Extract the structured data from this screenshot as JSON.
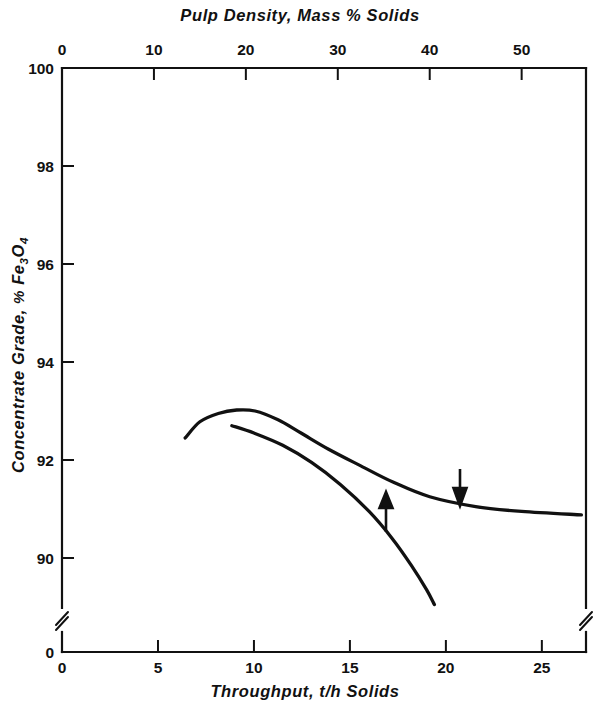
{
  "chart_data": {
    "type": "line",
    "title": "",
    "top_axis": {
      "label": "Pulp Density, Mass % Solids",
      "ticks": [
        0,
        10,
        20,
        30,
        40,
        50
      ],
      "tick_labels": [
        "0",
        "10",
        "20",
        "30",
        "40",
        "50"
      ],
      "range": [
        0,
        57
      ]
    },
    "xlabel": "Throughput, t/h Solids",
    "x_ticks": [
      0,
      5,
      10,
      15,
      20,
      25
    ],
    "x_tick_labels": [
      "0",
      "5",
      "10",
      "15",
      "20",
      "25"
    ],
    "xlim": [
      0,
      27.3
    ],
    "ylabel": "Concentrate Grade, % Fe3O4",
    "ylabel_parts": {
      "lead": "Concentrate Grade, ",
      "pct": "%",
      "fe": "Fe",
      "sub3": "3",
      "o": "O",
      "sub4": "4"
    },
    "y_ticks": [
      90,
      92,
      94,
      96,
      98,
      100
    ],
    "y_tick_labels": [
      "90",
      "92",
      "94",
      "96",
      "98",
      "100"
    ],
    "y_origin_label": "0",
    "ylim": [
      90,
      100
    ],
    "axis_break": true,
    "axis_break_note": "y-axis broken between 0 and 90; x-axis broken at both ends near origin level",
    "grid": false,
    "legend": null,
    "series": [
      {
        "name": "Pulp density curve (top axis)",
        "axis": "top",
        "arrow": "down",
        "points": [
          [
            13.4,
            92.45
          ],
          [
            15.0,
            92.78
          ],
          [
            17.0,
            92.95
          ],
          [
            19.0,
            93.02
          ],
          [
            21.0,
            93.0
          ],
          [
            23.5,
            92.82
          ],
          [
            26.0,
            92.55
          ],
          [
            29.0,
            92.22
          ],
          [
            32.5,
            91.88
          ],
          [
            36.0,
            91.55
          ],
          [
            40.0,
            91.25
          ],
          [
            45.0,
            91.05
          ],
          [
            50.0,
            90.95
          ],
          [
            56.5,
            90.88
          ]
        ]
      },
      {
        "name": "Throughput curve (bottom axis)",
        "axis": "bottom",
        "arrow": "up",
        "points": [
          [
            8.85,
            92.7
          ],
          [
            10.0,
            92.55
          ],
          [
            11.5,
            92.3
          ],
          [
            13.0,
            91.95
          ],
          [
            14.5,
            91.5
          ],
          [
            16.0,
            90.95
          ],
          [
            17.2,
            90.4
          ],
          [
            18.2,
            89.85
          ],
          [
            19.0,
            89.35
          ],
          [
            19.4,
            89.05
          ]
        ]
      }
    ],
    "annotations": [
      {
        "name": "up-arrow",
        "symbol": "↑",
        "x_px": 386,
        "y_top_px": 495,
        "y_bot_px": 532,
        "points_to": "Throughput curve (bottom axis)"
      },
      {
        "name": "down-arrow",
        "symbol": "↓",
        "x_px": 460,
        "y_top_px": 469,
        "y_bot_px": 503,
        "points_to": "Pulp density curve (top axis)"
      }
    ]
  }
}
